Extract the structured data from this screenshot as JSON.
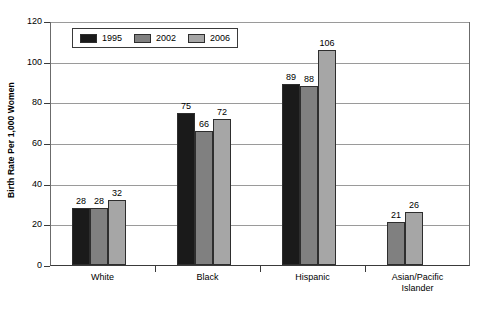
{
  "chart_data": {
    "type": "bar",
    "title": "",
    "subtitle": "",
    "xlabel": "",
    "ylabel": "Birth Rate Per 1,000 Women",
    "ylim": [
      0,
      120
    ],
    "ytick_labels": [
      "0",
      "20",
      "40",
      "60",
      "80",
      "100",
      "120"
    ],
    "ytick_values": [
      0,
      20,
      40,
      60,
      80,
      100,
      120
    ],
    "grid": true,
    "legend_position": "top-left-inside",
    "categories": [
      "White",
      "Black",
      "Hispanic",
      "Asian/Pacific Islander"
    ],
    "category_label_lines": [
      [
        "White"
      ],
      [
        "Black"
      ],
      [
        "Hispanic"
      ],
      [
        "Asian/Pacific",
        "Islander"
      ]
    ],
    "series": [
      {
        "name": "1995",
        "color": "#1a1a1a",
        "values": [
          28,
          75,
          89,
          null
        ],
        "value_labels": [
          "28",
          "75",
          "89",
          ""
        ]
      },
      {
        "name": "2002",
        "color": "#808080",
        "values": [
          28,
          66,
          88,
          21
        ],
        "value_labels": [
          "28",
          "66",
          "88",
          "21"
        ]
      },
      {
        "name": "2006",
        "color": "#a6a6a6",
        "values": [
          32,
          72,
          106,
          26
        ],
        "value_labels": [
          "32",
          "72",
          "106",
          "26"
        ]
      }
    ]
  },
  "legend": {
    "entries": [
      {
        "label": "1995",
        "color": "#1a1a1a"
      },
      {
        "label": "2002",
        "color": "#808080"
      },
      {
        "label": "2006",
        "color": "#a6a6a6"
      }
    ]
  },
  "axis": {
    "y_title": "Birth Rate Per 1,000 Women"
  }
}
